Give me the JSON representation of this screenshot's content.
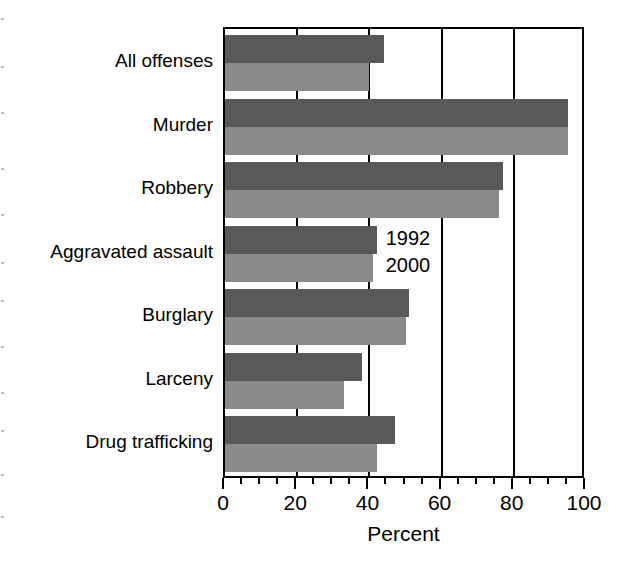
{
  "chart_data": {
    "type": "bar",
    "orientation": "horizontal",
    "title": "",
    "xlabel": "Percent",
    "ylabel": "",
    "xlim": [
      0,
      100
    ],
    "xticks": [
      0,
      20,
      40,
      60,
      80,
      100
    ],
    "xtick_labels": [
      "0",
      "20",
      "40",
      "60",
      "80",
      "100"
    ],
    "minor_tick_interval": 5,
    "grid": "vertical gridlines at 20, 40, 60, 80",
    "legend_position": "inline annotation beside Aggravated assault bars",
    "categories": [
      "All offenses",
      "Murder",
      "Robbery",
      "Aggravated assault",
      "Burglary",
      "Larceny",
      "Drug trafficking"
    ],
    "series": [
      {
        "name": "1992",
        "color": "#595959",
        "values": [
          44,
          95,
          77,
          42,
          51,
          38,
          47
        ]
      },
      {
        "name": "2000",
        "color": "#8a8a8a",
        "values": [
          40,
          95,
          76,
          41,
          50,
          33,
          42
        ]
      }
    ],
    "annotations": [
      {
        "text": "1992",
        "series": "1992"
      },
      {
        "text": "2000",
        "series": "2000"
      }
    ]
  },
  "colors": {
    "series_1992": "#595959",
    "series_2000": "#8a8a8a",
    "axis": "#000000",
    "background": "#ffffff"
  }
}
